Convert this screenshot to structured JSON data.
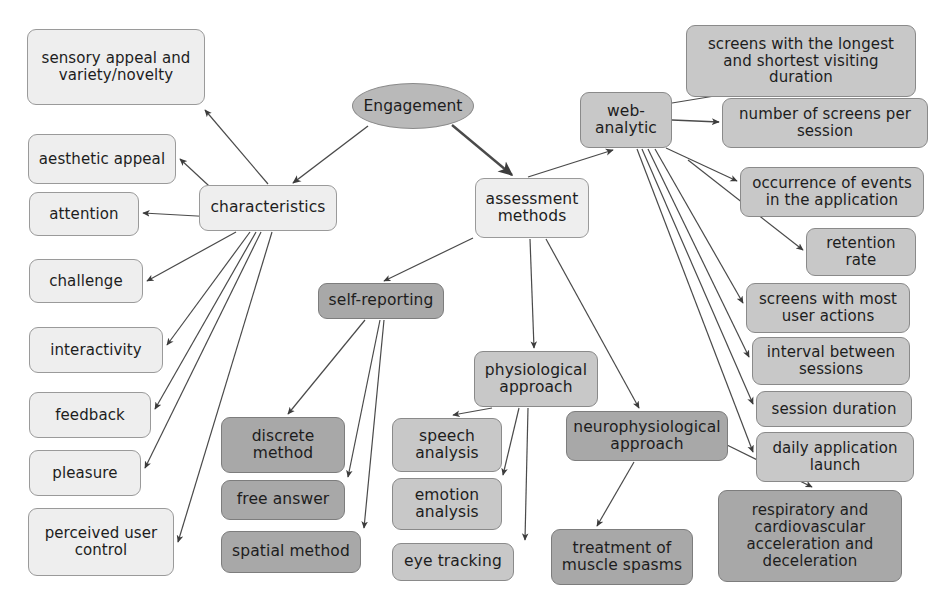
{
  "diagram": {
    "background": "#ffffff",
    "palette": {
      "light": "#eeeeee",
      "mid": "#c8c8c8",
      "dark": "#a8a8a8",
      "root": "#b9b9b9",
      "stroke": "#8d8d8d",
      "edge": "#4a4a4a",
      "text": "#1d1d1d"
    }
  },
  "nodes": [
    {
      "id": "engagement",
      "label": "Engagement",
      "shape": "ellipse",
      "tone": "root",
      "x": 352,
      "y": 83,
      "w": 122,
      "h": 46,
      "font": 15.5
    },
    {
      "id": "characteristics",
      "label": "characteristics",
      "shape": "rounded",
      "tone": "light",
      "x": 199,
      "y": 185,
      "w": 138,
      "h": 46,
      "font": 15.5
    },
    {
      "id": "assessment-methods",
      "label": "assessment\nmethods",
      "shape": "rounded",
      "tone": "light",
      "x": 475,
      "y": 178,
      "w": 114,
      "h": 60,
      "font": 15.5
    },
    {
      "id": "web-analytic",
      "label": "web-\nanalytic",
      "shape": "rounded",
      "tone": "mid",
      "x": 580,
      "y": 92,
      "w": 92,
      "h": 56,
      "font": 15.5
    },
    {
      "id": "sensory-appeal",
      "label": "sensory appeal and\nvariety/novelty",
      "shape": "rounded",
      "tone": "light",
      "x": 27,
      "y": 29,
      "w": 178,
      "h": 76,
      "font": 15
    },
    {
      "id": "aesthetic-appeal",
      "label": "aesthetic appeal",
      "shape": "rounded",
      "tone": "light",
      "x": 28,
      "y": 134,
      "w": 148,
      "h": 50,
      "font": 15
    },
    {
      "id": "attention",
      "label": "attention",
      "shape": "rounded",
      "tone": "light",
      "x": 29,
      "y": 192,
      "w": 110,
      "h": 44,
      "font": 15
    },
    {
      "id": "challenge",
      "label": "challenge",
      "shape": "rounded",
      "tone": "light",
      "x": 29,
      "y": 259,
      "w": 114,
      "h": 44,
      "font": 15
    },
    {
      "id": "interactivity",
      "label": "interactivity",
      "shape": "rounded",
      "tone": "light",
      "x": 29,
      "y": 327,
      "w": 134,
      "h": 46,
      "font": 15
    },
    {
      "id": "feedback",
      "label": "feedback",
      "shape": "rounded",
      "tone": "light",
      "x": 29,
      "y": 392,
      "w": 122,
      "h": 46,
      "font": 15
    },
    {
      "id": "pleasure",
      "label": "pleasure",
      "shape": "rounded",
      "tone": "light",
      "x": 29,
      "y": 450,
      "w": 112,
      "h": 46,
      "font": 15
    },
    {
      "id": "perceived-user-control",
      "label": "perceived user\ncontrol",
      "shape": "rounded",
      "tone": "light",
      "x": 28,
      "y": 508,
      "w": 146,
      "h": 68,
      "font": 15
    },
    {
      "id": "self-reporting",
      "label": "self-reporting",
      "shape": "rounded",
      "tone": "dark",
      "x": 318,
      "y": 283,
      "w": 126,
      "h": 36,
      "font": 15.5
    },
    {
      "id": "discrete-method",
      "label": "discrete\nmethod",
      "shape": "rounded",
      "tone": "dark",
      "x": 221,
      "y": 417,
      "w": 124,
      "h": 56,
      "font": 15.5
    },
    {
      "id": "free-answer",
      "label": "free answer",
      "shape": "rounded",
      "tone": "dark",
      "x": 221,
      "y": 480,
      "w": 124,
      "h": 40,
      "font": 15.5
    },
    {
      "id": "spatial-method",
      "label": "spatial method",
      "shape": "rounded",
      "tone": "dark",
      "x": 221,
      "y": 531,
      "w": 140,
      "h": 42,
      "font": 15.5
    },
    {
      "id": "physiological-approach",
      "label": "physiological\napproach",
      "shape": "rounded",
      "tone": "mid",
      "x": 474,
      "y": 351,
      "w": 124,
      "h": 56,
      "font": 15.5
    },
    {
      "id": "speech-analysis",
      "label": "speech\nanalysis",
      "shape": "rounded",
      "tone": "mid",
      "x": 392,
      "y": 418,
      "w": 110,
      "h": 54,
      "font": 15.5
    },
    {
      "id": "emotion-analysis",
      "label": "emotion\nanalysis",
      "shape": "rounded",
      "tone": "mid",
      "x": 392,
      "y": 478,
      "w": 110,
      "h": 52,
      "font": 15.5
    },
    {
      "id": "eye-tracking",
      "label": "eye tracking",
      "shape": "rounded",
      "tone": "mid",
      "x": 392,
      "y": 543,
      "w": 122,
      "h": 38,
      "font": 15.5
    },
    {
      "id": "neurophysiological-approach",
      "label": "neurophysiological\napproach",
      "shape": "rounded",
      "tone": "dark",
      "x": 566,
      "y": 411,
      "w": 162,
      "h": 50,
      "font": 15.5
    },
    {
      "id": "treatment-muscle-spasms",
      "label": "treatment of\nmuscle spasms",
      "shape": "rounded",
      "tone": "dark",
      "x": 551,
      "y": 529,
      "w": 142,
      "h": 56,
      "font": 15.5
    },
    {
      "id": "screens-longest-shortest",
      "label": "screens with the longest\nand shortest visiting\nduration",
      "shape": "rounded",
      "tone": "mid",
      "x": 686,
      "y": 25,
      "w": 230,
      "h": 72,
      "font": 15
    },
    {
      "id": "number-of-screens",
      "label": "number of screens per\nsession",
      "shape": "rounded",
      "tone": "mid",
      "x": 722,
      "y": 98,
      "w": 206,
      "h": 50,
      "font": 15
    },
    {
      "id": "occurrence-of-events",
      "label": "occurrence of events\nin the application",
      "shape": "rounded",
      "tone": "mid",
      "x": 740,
      "y": 167,
      "w": 184,
      "h": 50,
      "font": 15
    },
    {
      "id": "retention-rate",
      "label": "retention\nrate",
      "shape": "rounded",
      "tone": "mid",
      "x": 806,
      "y": 228,
      "w": 110,
      "h": 48,
      "font": 15
    },
    {
      "id": "screens-most-user-actions",
      "label": "screens with most\nuser actions",
      "shape": "rounded",
      "tone": "mid",
      "x": 746,
      "y": 283,
      "w": 164,
      "h": 50,
      "font": 15
    },
    {
      "id": "interval-between-sessions",
      "label": "interval between\nsessions",
      "shape": "rounded",
      "tone": "mid",
      "x": 752,
      "y": 337,
      "w": 158,
      "h": 48,
      "font": 15
    },
    {
      "id": "session-duration",
      "label": "session duration",
      "shape": "rounded",
      "tone": "mid",
      "x": 756,
      "y": 391,
      "w": 156,
      "h": 36,
      "font": 15
    },
    {
      "id": "daily-application-launch",
      "label": "daily application\nlaunch",
      "shape": "rounded",
      "tone": "mid",
      "x": 756,
      "y": 432,
      "w": 158,
      "h": 50,
      "font": 15
    },
    {
      "id": "respiratory-cardiovascular",
      "label": "respiratory and\ncardiovascular\nacceleration and\ndeceleration",
      "shape": "rounded",
      "tone": "dark",
      "x": 718,
      "y": 490,
      "w": 184,
      "h": 92,
      "font": 15
    }
  ],
  "edges": [
    {
      "from": "engagement",
      "to": "characteristics",
      "path": "M 368,126 L 293,183",
      "weight": 1.4
    },
    {
      "from": "engagement",
      "to": "assessment-methods",
      "path": "M 452,125 L 512,175",
      "weight": 2.4
    },
    {
      "from": "characteristics",
      "to": "sensory-appeal",
      "path": "M 268,184 L 205,110",
      "weight": 1.2
    },
    {
      "from": "characteristics",
      "to": "aesthetic-appeal",
      "path": "M 222,198 L 180,159",
      "weight": 1.2
    },
    {
      "from": "characteristics",
      "to": "attention",
      "path": "M 215,217 L 143,213",
      "weight": 1.2
    },
    {
      "from": "characteristics",
      "to": "challenge",
      "path": "M 236,232 L 147,281",
      "weight": 1.2
    },
    {
      "from": "characteristics",
      "to": "interactivity",
      "path": "M 250,232 L 167,345",
      "weight": 1.2
    },
    {
      "from": "characteristics",
      "to": "feedback",
      "path": "M 256,232 L 155,409",
      "weight": 1.2
    },
    {
      "from": "characteristics",
      "to": "pleasure",
      "path": "M 261,232 L 145,468",
      "weight": 1.2
    },
    {
      "from": "characteristics",
      "to": "perceived-user-control",
      "path": "M 272,232 L 178,542",
      "weight": 1.2
    },
    {
      "from": "assessment-methods",
      "to": "web-analytic",
      "path": "M 528,177 L 613,150",
      "weight": 1.3
    },
    {
      "from": "assessment-methods",
      "to": "self-reporting",
      "path": "M 473,238 L 384,281",
      "weight": 1.2
    },
    {
      "from": "assessment-methods",
      "to": "physiological-approach",
      "path": "M 530,239 L 534,348",
      "weight": 1.2
    },
    {
      "from": "assessment-methods",
      "to": "neurophysiological-approach",
      "path": "M 546,239 L 639,408",
      "weight": 1.2
    },
    {
      "from": "self-reporting",
      "to": "discrete-method",
      "path": "M 365,320 L 288,414",
      "weight": 1.2
    },
    {
      "from": "self-reporting",
      "to": "free-answer",
      "path": "M 380,320 L 348,477",
      "weight": 1.2
    },
    {
      "from": "self-reporting",
      "to": "spatial-method",
      "path": "M 384,320 L 364,528",
      "weight": 1.2
    },
    {
      "from": "physiological-approach",
      "to": "speech-analysis",
      "path": "M 492,408 L 453,415",
      "weight": 1.2
    },
    {
      "from": "physiological-approach",
      "to": "emotion-analysis",
      "path": "M 519,408 L 503,475",
      "weight": 1.2
    },
    {
      "from": "physiological-approach",
      "to": "eye-tracking",
      "path": "M 528,408 L 525,540",
      "weight": 1.2
    },
    {
      "from": "neurophysiological-approach",
      "to": "treatment-muscle-spasms",
      "path": "M 634,462 L 597,526",
      "weight": 1.2
    },
    {
      "from": "neurophysiological-approach",
      "to": "respiratory-cardiovascular",
      "path": "M 727,445 L 812,487",
      "weight": 1.2
    },
    {
      "from": "web-analytic",
      "to": "screens-longest-shortest",
      "path": "M 672,103 L 739,92",
      "weight": 1.2
    },
    {
      "from": "web-analytic",
      "to": "number-of-screens",
      "path": "M 672,120 L 719,122",
      "weight": 1.3
    },
    {
      "from": "web-analytic",
      "to": "occurrence-of-events",
      "path": "M 666,148 L 737,181",
      "weight": 1.2
    },
    {
      "from": "web-analytic",
      "to": "retention-rate",
      "path": "M 688,160 L 803,250",
      "weight": 1.2
    },
    {
      "from": "web-analytic",
      "to": "screens-most-user-actions",
      "path": "M 655,149 L 743,303",
      "weight": 1.2
    },
    {
      "from": "web-analytic",
      "to": "interval-between-sessions",
      "path": "M 648,149 L 749,357",
      "weight": 1.2
    },
    {
      "from": "web-analytic",
      "to": "session-duration",
      "path": "M 642,149 L 753,404",
      "weight": 1.2
    },
    {
      "from": "web-analytic",
      "to": "daily-application-launch",
      "path": "M 637,149 L 753,452",
      "weight": 1.2
    }
  ]
}
